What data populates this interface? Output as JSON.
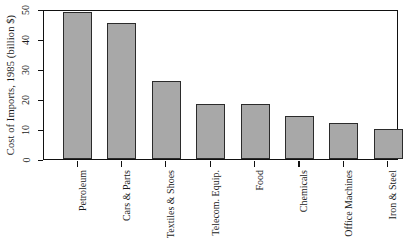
{
  "chart_data": {
    "type": "bar",
    "title": "",
    "xlabel": "",
    "ylabel": "Cost of Imports, 1985 (billion $)",
    "categories": [
      "Petroleum",
      "Cars & Parts",
      "Textiles & Shoes",
      "Telecom. Equip.",
      "Food",
      "Chemicals",
      "Office Machines",
      "Iron & Steel"
    ],
    "values": [
      49,
      45.5,
      26,
      18.5,
      18.5,
      14.3,
      12,
      10
    ],
    "ylim": [
      0,
      50
    ],
    "yticks": [
      0,
      10,
      20,
      30,
      40,
      50
    ],
    "ytick_labels": [
      "0",
      "10",
      "20",
      "30",
      "40",
      "50"
    ],
    "grid": false,
    "legend": null,
    "bar_fill_color": "#a8a8a8",
    "bar_edge_color": "#2b2b2b",
    "axis_color": "#111111",
    "background_color": "#ffffff"
  }
}
